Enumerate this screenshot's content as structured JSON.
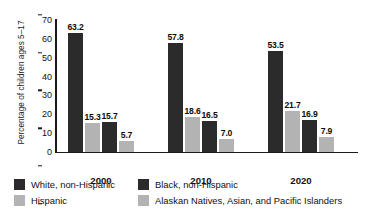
{
  "chart_data": {
    "type": "bar",
    "title": "",
    "xlabel": "",
    "ylabel": "Percentage of children ages 5–17",
    "ylim": [
      0,
      70
    ],
    "ytick_step": 10,
    "yticks": [
      "70",
      "60",
      "50",
      "40",
      "30",
      "20",
      "10",
      "0"
    ],
    "grid": false,
    "legend_position": "bottom",
    "categories": [
      "2000",
      "2010",
      "2020"
    ],
    "series": [
      {
        "name": "White, non-Hispanic",
        "color": "#2b2b2b",
        "style": "dark",
        "values": [
          63.2,
          57.8,
          53.5
        ],
        "labels": [
          "63.2",
          "57.8",
          "53.5"
        ]
      },
      {
        "name": "Hispanic",
        "color": "#b3b3b3",
        "style": "light",
        "values": [
          15.3,
          18.6,
          21.7
        ],
        "labels": [
          "15.3",
          "18.6",
          "21.7"
        ]
      },
      {
        "name": "Black, non-Hispanic",
        "color": "#2b2b2b",
        "style": "dark",
        "values": [
          15.7,
          16.5,
          16.9
        ],
        "labels": [
          "15.7",
          "16.5",
          "16.9"
        ]
      },
      {
        "name": "Alaskan Natives, Asian, and Pacific Islanders",
        "color": "#b3b3b3",
        "style": "light",
        "values": [
          5.7,
          7.0,
          7.9
        ],
        "labels": [
          "5.7",
          "7.0",
          "7.9"
        ]
      }
    ]
  },
  "axes": {
    "y_title": "Percentage of children ages 5–17",
    "y_ticks": [
      "70",
      "60",
      "50",
      "40",
      "30",
      "20",
      "10",
      "0"
    ],
    "x_ticks": [
      "2000",
      "2010",
      "2020"
    ]
  },
  "legend": {
    "entries": [
      {
        "label": "White, non-Hispanic",
        "swatch": "dark"
      },
      {
        "label": "Black, non-Hispanic",
        "swatch": "dark"
      },
      {
        "label": "Hispanic",
        "swatch": "light"
      },
      {
        "label": "Alaskan Natives, Asian, and Pacific Islanders",
        "swatch": "light"
      }
    ]
  },
  "colors": {
    "dark": "#2b2b2b",
    "light": "#b3b3b3",
    "axis": "#1a1a1a",
    "text": "#111111",
    "background": "#ffffff"
  }
}
